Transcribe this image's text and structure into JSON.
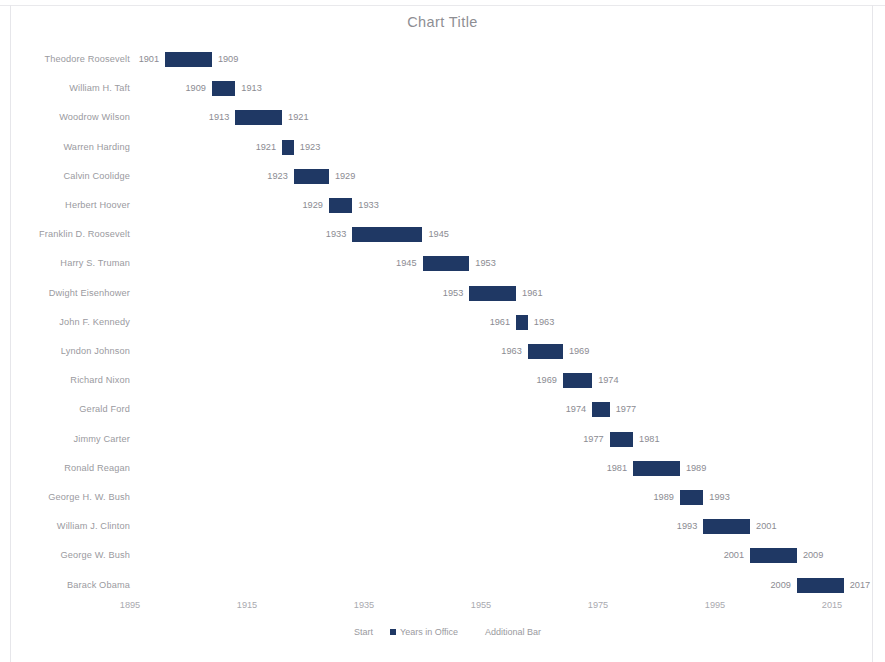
{
  "chart": {
    "title": "Chart Title"
  },
  "legend": {
    "items": [
      {
        "label": "Start",
        "swatch": false
      },
      {
        "label": "Years in Office",
        "swatch": true
      },
      {
        "label": "Additional Bar",
        "swatch": false
      }
    ]
  },
  "chart_data": {
    "type": "bar",
    "subtype": "gantt-stacked-bar",
    "title": "Chart Title",
    "xlabel": "",
    "ylabel": "",
    "orientation": "horizontal",
    "grid": false,
    "legend_position": "bottom",
    "xlim": [
      1895,
      2019
    ],
    "xticks": [
      1895,
      1915,
      1935,
      1955,
      1975,
      1995,
      2015
    ],
    "xticklabels": [
      "1895",
      "1915",
      "1935",
      "1955",
      "1975",
      "1995",
      "2015"
    ],
    "bar_color": "#1F3864",
    "label_color": "#8B8B92",
    "categories": [
      "Theodore Roosevelt",
      "William H. Taft",
      "Woodrow Wilson",
      "Warren Harding",
      "Calvin Coolidge",
      "Herbert Hoover",
      "Franklin D. Roosevelt",
      "Harry S. Truman",
      "Dwight Eisenhower",
      "John F. Kennedy",
      "Lyndon Johnson",
      "Richard Nixon",
      "Gerald Ford",
      "Jimmy Carter",
      "Ronald Reagan",
      "George H. W. Bush",
      "William J. Clinton",
      "George W. Bush",
      "Barack Obama"
    ],
    "series": [
      {
        "name": "Start",
        "values": [
          1901,
          1909,
          1913,
          1921,
          1923,
          1929,
          1933,
          1945,
          1953,
          1961,
          1963,
          1969,
          1974,
          1977,
          1981,
          1989,
          1993,
          2001,
          2009
        ]
      },
      {
        "name": "Years in Office",
        "values": [
          8,
          4,
          8,
          2,
          6,
          4,
          12,
          8,
          8,
          2,
          6,
          5,
          3,
          4,
          8,
          4,
          8,
          8,
          8
        ]
      },
      {
        "name": "Additional Bar",
        "values": [
          0,
          0,
          0,
          0,
          0,
          0,
          0,
          0,
          0,
          0,
          0,
          0,
          0,
          0,
          0,
          0,
          0,
          0,
          0
        ]
      }
    ],
    "end_values": [
      1909,
      1913,
      1921,
      1923,
      1929,
      1933,
      1945,
      1953,
      1961,
      1963,
      1969,
      1974,
      1977,
      1981,
      1989,
      1993,
      2001,
      2009,
      2017
    ],
    "rows": [
      {
        "label": "Theodore Roosevelt",
        "start": 1901,
        "end": 1909,
        "start_text": "1901",
        "end_text": "1909"
      },
      {
        "label": "William H. Taft",
        "start": 1909,
        "end": 1913,
        "start_text": "1909",
        "end_text": "1913"
      },
      {
        "label": "Woodrow Wilson",
        "start": 1913,
        "end": 1921,
        "start_text": "1913",
        "end_text": "1921"
      },
      {
        "label": "Warren Harding",
        "start": 1921,
        "end": 1923,
        "start_text": "1921",
        "end_text": "1923"
      },
      {
        "label": "Calvin Coolidge",
        "start": 1923,
        "end": 1929,
        "start_text": "1923",
        "end_text": "1929"
      },
      {
        "label": "Herbert Hoover",
        "start": 1929,
        "end": 1933,
        "start_text": "1929",
        "end_text": "1933"
      },
      {
        "label": "Franklin D. Roosevelt",
        "start": 1933,
        "end": 1945,
        "start_text": "1933",
        "end_text": "1945"
      },
      {
        "label": "Harry S. Truman",
        "start": 1945,
        "end": 1953,
        "start_text": "1945",
        "end_text": "1953"
      },
      {
        "label": "Dwight Eisenhower",
        "start": 1953,
        "end": 1961,
        "start_text": "1953",
        "end_text": "1961"
      },
      {
        "label": "John F. Kennedy",
        "start": 1961,
        "end": 1963,
        "start_text": "1961",
        "end_text": "1963"
      },
      {
        "label": "Lyndon Johnson",
        "start": 1963,
        "end": 1969,
        "start_text": "1963",
        "end_text": "1969"
      },
      {
        "label": "Richard Nixon",
        "start": 1969,
        "end": 1974,
        "start_text": "1969",
        "end_text": "1974"
      },
      {
        "label": "Gerald Ford",
        "start": 1974,
        "end": 1977,
        "start_text": "1974",
        "end_text": "1977"
      },
      {
        "label": "Jimmy Carter",
        "start": 1977,
        "end": 1981,
        "start_text": "1977",
        "end_text": "1981"
      },
      {
        "label": "Ronald Reagan",
        "start": 1981,
        "end": 1989,
        "start_text": "1981",
        "end_text": "1989"
      },
      {
        "label": "George H. W. Bush",
        "start": 1989,
        "end": 1993,
        "start_text": "1989",
        "end_text": "1993"
      },
      {
        "label": "William J. Clinton",
        "start": 1993,
        "end": 2001,
        "start_text": "1993",
        "end_text": "2001"
      },
      {
        "label": "George W. Bush",
        "start": 2001,
        "end": 2009,
        "start_text": "2001",
        "end_text": "2009"
      },
      {
        "label": "Barack Obama",
        "start": 2009,
        "end": 2017,
        "start_text": "2009",
        "end_text": "2017"
      }
    ]
  },
  "layout": {
    "plot_left_px": 130,
    "plot_x0_year": 1895,
    "px_per_year": 5.85,
    "first_row_top_px": 48,
    "row_pitch_px": 29.2
  }
}
